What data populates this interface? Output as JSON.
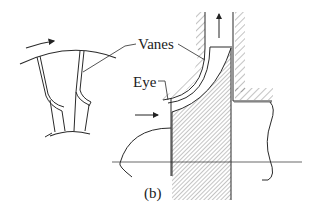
{
  "figure": {
    "labels": {
      "vanes": "Vanes",
      "eye": "Eye",
      "caption": "(b)"
    },
    "colors": {
      "line": "#2a2a2a",
      "hatch": "#555555",
      "background": "#ffffff"
    },
    "parts": [
      "impeller-front-view",
      "rotation-arrow",
      "impeller-cross-section",
      "inlet-flow-arrow",
      "outlet-flow-arrow",
      "shaft",
      "casing",
      "centerline"
    ]
  }
}
